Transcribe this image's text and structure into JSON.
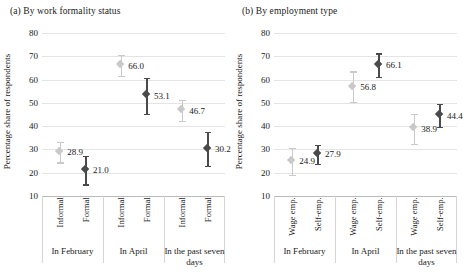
{
  "figure": {
    "width": 464,
    "height": 280,
    "background": "#ffffff"
  },
  "colors": {
    "light_marker": "#c9c9c9",
    "dark_marker": "#4a4a4a",
    "gridline": "#e4e4e4",
    "axis": "#b9b9b9",
    "text": "#1a1a1a"
  },
  "chart_data": [
    {
      "type": "scatter",
      "panel_id": "a",
      "title": "(a) By work formality status",
      "xlabel": "",
      "ylabel": "Percentage share of respondents",
      "ylim": [
        10,
        80
      ],
      "yticks": [
        10,
        20,
        30,
        40,
        50,
        60,
        70,
        80
      ],
      "grid": true,
      "legend": null,
      "group_labels": [
        "In February",
        "In April",
        "In the past seven days"
      ],
      "categories": [
        "Informal",
        "Formal",
        "Informal",
        "Formal",
        "Informal",
        "Formal"
      ],
      "series": [
        {
          "name": "Informal",
          "color": "#c9c9c9",
          "points": [
            {
              "group": "In February",
              "category": "Informal",
              "value": 28.9,
              "label": "28.9",
              "ci_low": 24.5,
              "ci_high": 33.2
            },
            {
              "group": "In April",
              "category": "Informal",
              "value": 66.0,
              "label": "66.0",
              "ci_low": 61.5,
              "ci_high": 70.5
            },
            {
              "group": "In the past seven days",
              "category": "Informal",
              "value": 46.7,
              "label": "46.7",
              "ci_low": 42.2,
              "ci_high": 51.2
            }
          ]
        },
        {
          "name": "Formal",
          "color": "#4a4a4a",
          "points": [
            {
              "group": "In February",
              "category": "Formal",
              "value": 21.0,
              "label": "21.0",
              "ci_low": 15.0,
              "ci_high": 27.2
            },
            {
              "group": "In April",
              "category": "Formal",
              "value": 53.1,
              "label": "53.1",
              "ci_low": 45.3,
              "ci_high": 60.8
            },
            {
              "group": "In the past seven days",
              "category": "Formal",
              "value": 30.2,
              "label": "30.2",
              "ci_low": 23.0,
              "ci_high": 37.5
            }
          ]
        }
      ]
    },
    {
      "type": "scatter",
      "panel_id": "b",
      "title": "(b) By employment type",
      "xlabel": "",
      "ylabel": "Percentage share of respondents",
      "ylim": [
        10,
        80
      ],
      "yticks": [
        10,
        20,
        30,
        40,
        50,
        60,
        70,
        80
      ],
      "grid": true,
      "legend": null,
      "group_labels": [
        "In February",
        "In April",
        "In the past seven days"
      ],
      "categories": [
        "Wage emp.",
        "Self-emp.",
        "Wage emp.",
        "Self-emp.",
        "Wage emp.",
        "Self-emp."
      ],
      "series": [
        {
          "name": "Wage emp.",
          "color": "#c9c9c9",
          "points": [
            {
              "group": "In February",
              "category": "Wage emp.",
              "value": 24.9,
              "label": "24.9",
              "ci_low": 19.2,
              "ci_high": 30.6
            },
            {
              "group": "In April",
              "category": "Wage emp.",
              "value": 56.8,
              "label": "56.8",
              "ci_low": 50.3,
              "ci_high": 63.5
            },
            {
              "group": "In the past seven days",
              "category": "Wage emp.",
              "value": 38.9,
              "label": "38.9",
              "ci_low": 32.5,
              "ci_high": 45.2
            }
          ]
        },
        {
          "name": "Self-emp.",
          "color": "#4a4a4a",
          "points": [
            {
              "group": "In February",
              "category": "Self-emp.",
              "value": 27.9,
              "label": "27.9",
              "ci_low": 23.8,
              "ci_high": 32.1
            },
            {
              "group": "In April",
              "category": "Self-emp.",
              "value": 66.1,
              "label": "66.1",
              "ci_low": 61.2,
              "ci_high": 71.2
            },
            {
              "group": "In the past seven days",
              "category": "Self-emp.",
              "value": 44.4,
              "label": "44.4",
              "ci_low": 39.6,
              "ci_high": 49.5
            }
          ]
        }
      ]
    }
  ]
}
